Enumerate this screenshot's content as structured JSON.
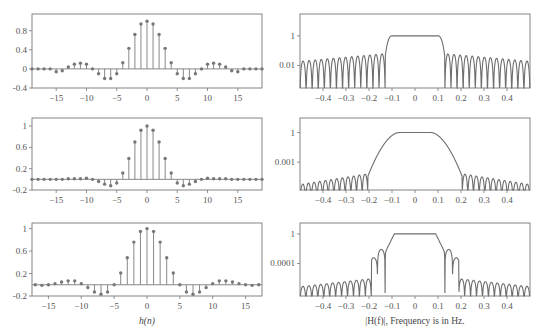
{
  "figure": {
    "left_xlabel": "h(n)",
    "right_xlabel": "|H(f)|, Frequency is in Hz."
  },
  "chart_data": [
    {
      "type": "stem",
      "panel": "row1-left",
      "title": "",
      "xlabel": "",
      "ylabel": "",
      "xlim": [
        -19,
        19
      ],
      "ylim": [
        -0.4,
        1.15
      ],
      "xticks": [
        -15,
        -10,
        -5,
        0,
        5,
        10,
        15
      ],
      "yticks": [
        -0.4,
        0,
        0.4,
        0.8
      ],
      "ytick_labels": [
        "-0.4",
        "0",
        "0.4",
        "0.8"
      ],
      "x": [
        -19,
        -18,
        -17,
        -16,
        -15,
        -14,
        -13,
        -12,
        -11,
        -10,
        -9,
        -8,
        -7,
        -6,
        -5,
        -4,
        -3,
        -2,
        -1,
        0,
        1,
        2,
        3,
        4,
        5,
        6,
        7,
        8,
        9,
        10,
        11,
        12,
        13,
        14,
        15,
        16,
        17,
        18,
        19
      ],
      "values": [
        0,
        0,
        0,
        0,
        -0.06,
        -0.04,
        0.04,
        0.1,
        0.12,
        0.1,
        0,
        -0.1,
        -0.2,
        -0.2,
        -0.1,
        0.13,
        0.43,
        0.72,
        0.94,
        1.0,
        0.94,
        0.72,
        0.43,
        0.13,
        -0.1,
        -0.2,
        -0.2,
        -0.1,
        0,
        0.1,
        0.12,
        0.1,
        0.04,
        -0.04,
        -0.06,
        0,
        0,
        0,
        0
      ]
    },
    {
      "type": "line",
      "scale": "log",
      "panel": "row1-right",
      "xlim": [
        -0.5,
        0.5
      ],
      "xticks": [
        -0.4,
        -0.3,
        -0.2,
        -0.1,
        0,
        0.1,
        0.2,
        0.3,
        0.4
      ],
      "yticks_log": [
        1,
        0.01
      ],
      "ytick_labels": [
        "1",
        "0.01"
      ],
      "ylim_log": [
        0.0003,
        30
      ],
      "description": "Rectangular-window lowpass: passband |f|<0.1 at ~1, sharp edge near ±0.13, ~18 stopband sidelobes per side with peaks ~0.02 rising to ~0.05 near edge",
      "passband_edge": 0.1,
      "stopband_edge": 0.13,
      "sidelobe_peak_far": 0.02,
      "sidelobe_peak_near": 0.06,
      "lobes_per_side": 14
    },
    {
      "type": "stem",
      "panel": "row2-left",
      "xlim": [
        -19,
        19
      ],
      "ylim": [
        -0.2,
        1.15
      ],
      "xticks": [
        -15,
        -10,
        -5,
        0,
        5,
        10,
        15
      ],
      "yticks": [
        -0.2,
        0.2,
        0.6,
        1
      ],
      "ytick_labels": [
        "-0.2",
        "0.2",
        "0.6",
        "1"
      ],
      "x": [
        -19,
        -18,
        -17,
        -16,
        -15,
        -14,
        -13,
        -12,
        -11,
        -10,
        -9,
        -8,
        -7,
        -6,
        -5,
        -4,
        -3,
        -2,
        -1,
        0,
        1,
        2,
        3,
        4,
        5,
        6,
        7,
        8,
        9,
        10,
        11,
        12,
        13,
        14,
        15,
        16,
        17,
        18,
        19
      ],
      "values": [
        0,
        0,
        0,
        0,
        0,
        0,
        0.01,
        0.01,
        0.01,
        0.02,
        0,
        -0.04,
        -0.09,
        -0.12,
        -0.07,
        0.12,
        0.39,
        0.7,
        0.92,
        1.0,
        0.92,
        0.7,
        0.39,
        0.12,
        -0.07,
        -0.12,
        -0.09,
        -0.04,
        0,
        0.02,
        0.01,
        0.01,
        0.01,
        0,
        0,
        0,
        0,
        0,
        0
      ]
    },
    {
      "type": "line",
      "scale": "log",
      "panel": "row2-right",
      "xlim": [
        -0.5,
        0.5
      ],
      "xticks": [
        -0.4,
        -0.3,
        -0.2,
        -0.1,
        0,
        0.1,
        0.2,
        0.3,
        0.4
      ],
      "yticks_log": [
        1,
        0.001
      ],
      "ytick_labels": [
        "1",
        "0.001"
      ],
      "ylim_log": [
        1.5e-06,
        30
      ],
      "description": "Smooth-window lowpass: wide rounded transition from 0.07 to 0.21, stopband sidelobes ~1e-5 rising to ~1e-4 near edge",
      "passband_edge": 0.07,
      "stopband_edge": 0.205,
      "sidelobe_peak_far": 6e-06,
      "sidelobe_peak_near": 6e-05,
      "lobes_per_side": 12
    },
    {
      "type": "stem",
      "panel": "row3-left",
      "xlim": [
        -17.5,
        17.5
      ],
      "ylim": [
        -0.2,
        1.1
      ],
      "xticks": [
        -15,
        -10,
        -5,
        0,
        5,
        10,
        15
      ],
      "yticks": [
        -0.2,
        0.2,
        0.6,
        1
      ],
      "ytick_labels": [
        "-0.2",
        "0.2",
        "0.6",
        "1"
      ],
      "x": [
        -17,
        -16,
        -15,
        -14,
        -13,
        -12,
        -11,
        -10,
        -9,
        -8,
        -7,
        -6,
        -5,
        -4,
        -3,
        -2,
        -1,
        0,
        1,
        2,
        3,
        4,
        5,
        6,
        7,
        8,
        9,
        10,
        11,
        12,
        13,
        14,
        15,
        16,
        17
      ],
      "values": [
        0,
        -0.01,
        0,
        0.02,
        0.05,
        0.07,
        0.07,
        0.02,
        -0.05,
        -0.13,
        -0.17,
        -0.13,
        0,
        0.21,
        0.48,
        0.76,
        0.95,
        1.0,
        0.95,
        0.76,
        0.48,
        0.21,
        0,
        -0.13,
        -0.17,
        -0.13,
        -0.05,
        0.02,
        0.07,
        0.07,
        0.05,
        0.02,
        0,
        -0.01,
        0
      ]
    },
    {
      "type": "line",
      "scale": "log",
      "panel": "row3-right",
      "xlim": [
        -0.5,
        0.5
      ],
      "xticks": [
        -0.4,
        -0.3,
        -0.2,
        -0.1,
        0,
        0.1,
        0.2,
        0.3,
        0.4
      ],
      "yticks_log": [
        1,
        0.0001
      ],
      "ytick_labels": [
        "1",
        "0.0001"
      ],
      "ylim_log": [
        4e-09,
        30
      ],
      "description": "Optimized lowpass: passband |f|<0.09, two large transition lobes near ±0.13 and ±0.17 (~0.01, ~0.0005), stopband from ±0.19 with sidelobes ~1e-7 to 1e-6",
      "passband_edge": 0.09,
      "stopband_edge": 0.19,
      "sidelobe_peak_far": 8e-08,
      "sidelobe_peak_near": 8e-07,
      "lobes_per_side": 12
    }
  ]
}
